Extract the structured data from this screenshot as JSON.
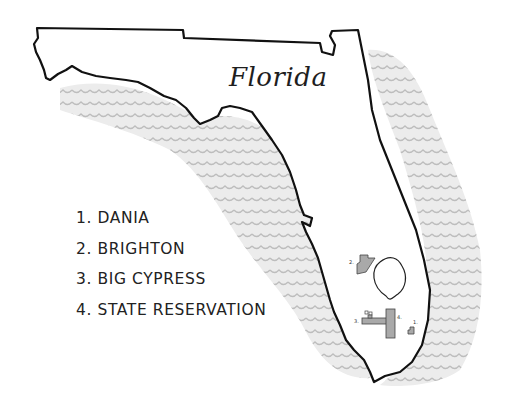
{
  "map": {
    "title": "Florida",
    "colors": {
      "outline": "#111111",
      "water_fill": "#ececec",
      "wave_stroke": "#b8b8b8",
      "reservation_fill": "#a9a9a9",
      "background": "#ffffff"
    },
    "legend": [
      {
        "number": "1.",
        "name": "DANIA",
        "label": "1. DANIA"
      },
      {
        "number": "2.",
        "name": "BRIGHTON",
        "label": "2. BRIGHTON"
      },
      {
        "number": "3.",
        "name": "BIG CYPRESS",
        "label": "3. BIG CYPRESS"
      },
      {
        "number": "4.",
        "name": "STATE RESERVATION",
        "label": "4. STATE RESERVATION"
      }
    ],
    "markers": {
      "dania": "1.",
      "brighton": "2.",
      "big_cypress": "3.",
      "state_reservation": "4."
    },
    "features": [
      "lake-okeechobee",
      "gulf-of-mexico-waves",
      "atlantic-ocean-waves"
    ]
  }
}
